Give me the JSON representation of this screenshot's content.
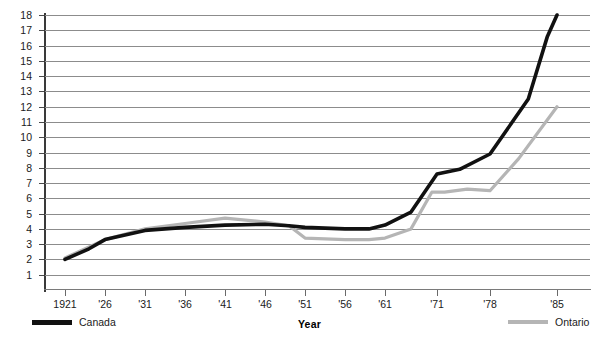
{
  "chart_data": {
    "type": "line",
    "title": "",
    "xlabel": "Year",
    "ylabel": "",
    "grid": true,
    "legend_position": "bottom",
    "x": [
      "1921",
      "'26",
      "'31",
      "'36",
      "'41",
      "'46",
      "'51",
      "'56",
      "'61",
      "'71",
      "'78",
      "'85"
    ],
    "xtick_labels": [
      "1921",
      "'26",
      "'31",
      "'36",
      "'41",
      "'46",
      "'51",
      "'56",
      "'61",
      "'71",
      "'78",
      "'85"
    ],
    "ytick_labels": [
      "18",
      "17",
      "16",
      "15",
      "14",
      "13",
      "12",
      "11",
      "10",
      "9",
      "8",
      "7",
      "6",
      "5",
      "4",
      "3",
      "2",
      "1"
    ],
    "ylim": [
      0,
      18
    ],
    "series": [
      {
        "name": "Canada",
        "color": "#111111",
        "values": [
          2.0,
          3.3,
          3.9,
          4.1,
          4.25,
          4.25,
          4.15,
          4.0,
          4.0,
          5.4,
          8.9,
          18.0
        ],
        "detail_points": [
          {
            "x": "1921",
            "y": 2.0
          },
          {
            "x": "'24",
            "y": 2.7
          },
          {
            "x": "'26",
            "y": 3.3
          },
          {
            "x": "'31",
            "y": 3.9
          },
          {
            "x": "'36",
            "y": 4.1
          },
          {
            "x": "'41",
            "y": 4.25
          },
          {
            "x": "'46",
            "y": 4.3
          },
          {
            "x": "'49",
            "y": 4.2
          },
          {
            "x": "'51",
            "y": 4.1
          },
          {
            "x": "'56",
            "y": 4.0
          },
          {
            "x": "'59",
            "y": 4.0
          },
          {
            "x": "'61",
            "y": 4.25
          },
          {
            "x": "'66",
            "y": 5.1
          },
          {
            "x": "'71",
            "y": 7.6
          },
          {
            "x": "'74",
            "y": 7.9
          },
          {
            "x": "'78",
            "y": 8.9
          },
          {
            "x": "'82",
            "y": 12.5
          },
          {
            "x": "'84",
            "y": 16.6
          },
          {
            "x": "'85",
            "y": 18.0
          }
        ]
      },
      {
        "name": "Ontario",
        "color": "#b5b5b5",
        "values": [
          2.1,
          3.3,
          4.0,
          4.35,
          4.7,
          4.5,
          4.2,
          3.3,
          3.35,
          4.8,
          6.5,
          12.0
        ],
        "detail_points": [
          {
            "x": "1921",
            "y": 2.1
          },
          {
            "x": "'26",
            "y": 3.3
          },
          {
            "x": "'31",
            "y": 4.0
          },
          {
            "x": "'36",
            "y": 4.35
          },
          {
            "x": "'41",
            "y": 4.7
          },
          {
            "x": "'46",
            "y": 4.45
          },
          {
            "x": "'49",
            "y": 4.2
          },
          {
            "x": "'51",
            "y": 3.4
          },
          {
            "x": "'56",
            "y": 3.3
          },
          {
            "x": "'59",
            "y": 3.3
          },
          {
            "x": "'61",
            "y": 3.4
          },
          {
            "x": "'66",
            "y": 4.0
          },
          {
            "x": "'70",
            "y": 6.4
          },
          {
            "x": "'72",
            "y": 6.4
          },
          {
            "x": "'75",
            "y": 6.6
          },
          {
            "x": "'78",
            "y": 6.5
          },
          {
            "x": "'81",
            "y": 8.6
          },
          {
            "x": "'85",
            "y": 12.0
          }
        ]
      }
    ],
    "legend": [
      {
        "label": "Canada",
        "color": "#111111"
      },
      {
        "label": "Ontario",
        "color": "#b5b5b5"
      }
    ]
  },
  "axis": {
    "x_title": "Year"
  }
}
